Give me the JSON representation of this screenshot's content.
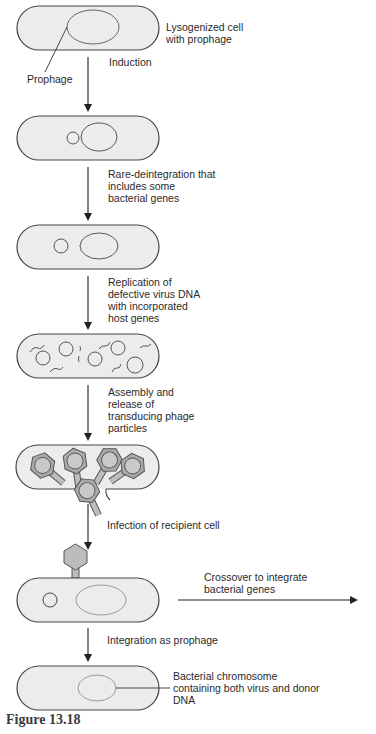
{
  "figure": {
    "caption": "Figure 13.18",
    "colors": {
      "cell_fill": "#ececec",
      "outline": "#444444",
      "phage_fill": "#b9b9b9",
      "phage_head_inner": "#c9c9c9",
      "chromosome_light": "#9a9a9a",
      "background": "#ffffff"
    }
  },
  "labels": {
    "lysogenized": "Lysogenized cell\nwith prophage",
    "prophage": "Prophage",
    "induction": "Induction",
    "rare_deintegration": "Rare-deintegration that\nincludes some\nbacterial genes",
    "replication": "Replication of\ndefective virus DNA\nwith incorporated\nhost genes",
    "assembly": "Assembly and\nrelease of\ntransducing phage\nparticles",
    "infection": "Infection of recipient cell",
    "crossover": "Crossover to integrate\nbacterial genes",
    "integration": "Integration as prophage",
    "bacterial_chromosome": "Bacterial chromosome\ncontaining both virus and donor\nDNA"
  },
  "steps": [
    {
      "id": 1,
      "state": "Lysogenized cell with prophage"
    },
    {
      "id": 2,
      "state": "Induction"
    },
    {
      "id": 3,
      "state": "Rare-deintegration that includes some bacterial genes"
    },
    {
      "id": 4,
      "state": "Replication of defective virus DNA with incorporated host genes"
    },
    {
      "id": 5,
      "state": "Assembly and release of transducing phage particles"
    },
    {
      "id": 6,
      "state": "Infection of recipient cell"
    },
    {
      "id": 7,
      "state": "Integration as prophage"
    }
  ]
}
